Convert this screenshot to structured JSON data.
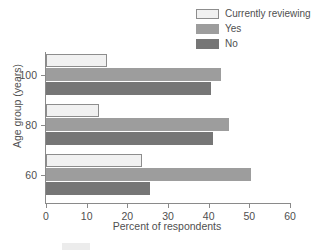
{
  "chart_data": {
    "type": "bar",
    "orientation": "horizontal",
    "title": "",
    "xlabel": "Percent of respondents",
    "ylabel": "Age group (years)",
    "categories": [
      "100",
      "80",
      "60"
    ],
    "xlim": [
      0,
      60
    ],
    "xticks": [
      0,
      10,
      20,
      30,
      40,
      50,
      60
    ],
    "xticklabels": [
      "0",
      "10",
      "20",
      "30",
      "40",
      "50",
      "60"
    ],
    "yticklabels": [
      "100",
      "80",
      "60"
    ],
    "grid": false,
    "legend_position": "top-right",
    "series": [
      {
        "name": "Currently reviewing",
        "color": "#f1f1f1",
        "edgecolor": "#8d8d8d",
        "values": [
          15,
          13,
          23.5
        ]
      },
      {
        "name": "Yes",
        "color": "#9d9d9d",
        "edgecolor": "#9d9d9d",
        "values": [
          43,
          45,
          50.5
        ]
      },
      {
        "name": "No",
        "color": "#767676",
        "edgecolor": "#767676",
        "values": [
          40.5,
          41,
          25.5
        ]
      }
    ]
  }
}
